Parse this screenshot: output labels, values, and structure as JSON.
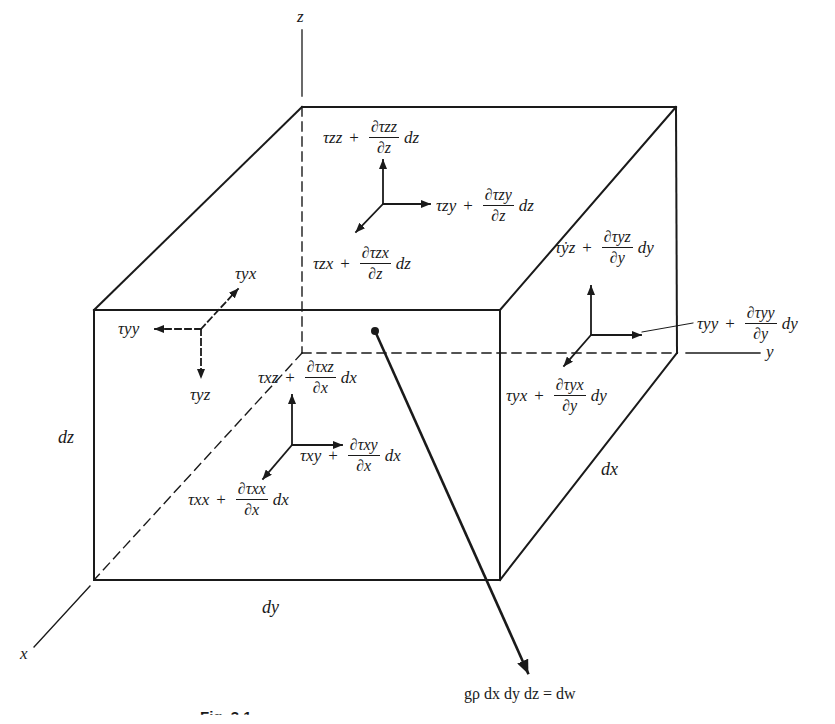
{
  "diagram": {
    "axes": {
      "x": "x",
      "y": "y",
      "z": "z"
    },
    "dimensions": {
      "dx": "dx",
      "dy": "dy",
      "dz": "dz"
    },
    "stresses": {
      "top_face": {
        "zz": {
          "base": "τzz",
          "num": "∂τzz",
          "den": "∂z",
          "tail": "dz"
        },
        "zy": {
          "base": "τzy",
          "num": "∂τzy",
          "den": "∂z",
          "tail": "dz"
        },
        "zx": {
          "base": "τzx",
          "num": "∂τzx",
          "den": "∂z",
          "tail": "dz"
        }
      },
      "left_face_hidden": {
        "yx": "τyx",
        "yy": "τyy",
        "yz": "τyz"
      },
      "right_face": {
        "yz": {
          "base": "τẏz",
          "num": "∂τyz",
          "den": "∂y",
          "tail": "dy"
        },
        "yy": {
          "base": "τyy",
          "num": "∂τyy",
          "den": "∂y",
          "tail": "dy"
        },
        "yx": {
          "base": "τyx",
          "num": "∂τyx",
          "den": "∂y",
          "tail": "dy"
        }
      },
      "front_face": {
        "xz": {
          "base": "τxz",
          "num": "∂τxz",
          "den": "∂x",
          "tail": "dx"
        },
        "xy": {
          "base": "τxy",
          "num": "∂τxy",
          "den": "∂x",
          "tail": "dx"
        },
        "xx": {
          "base": "τxx",
          "num": "∂τxx",
          "den": "∂x",
          "tail": "dx"
        }
      }
    },
    "plus": "+",
    "body_force": "gρ dx dy dz = dw",
    "caption": "Fig. 3.1"
  }
}
